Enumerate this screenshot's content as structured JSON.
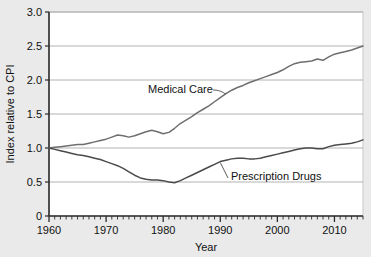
{
  "chart_data": {
    "type": "line",
    "title": "",
    "xlabel": "Year",
    "ylabel": "Index relative to CPI",
    "xlim": [
      1960,
      2015
    ],
    "ylim": [
      0,
      3.0
    ],
    "grid": true,
    "legend_position": "inline-annotation",
    "x_tick_labels": [
      "1960",
      "1970",
      "1980",
      "1990",
      "2000",
      "2010"
    ],
    "x_ticks": [
      1960,
      1970,
      1980,
      1990,
      2000,
      2010
    ],
    "x_minor_tick_step": 1,
    "y_tick_labels": [
      "0",
      "0.5",
      "1.0",
      "1.5",
      "2.0",
      "2.5",
      "3.0"
    ],
    "y_ticks": [
      0,
      0.5,
      1.0,
      1.5,
      2.0,
      2.5,
      3.0
    ],
    "x": [
      1960,
      1961,
      1962,
      1963,
      1964,
      1965,
      1966,
      1967,
      1968,
      1969,
      1970,
      1971,
      1972,
      1973,
      1974,
      1975,
      1976,
      1977,
      1978,
      1979,
      1980,
      1981,
      1982,
      1983,
      1984,
      1985,
      1986,
      1987,
      1988,
      1989,
      1990,
      1991,
      1992,
      1993,
      1994,
      1995,
      1996,
      1997,
      1998,
      1999,
      2000,
      2001,
      2002,
      2003,
      2004,
      2005,
      2006,
      2007,
      2008,
      2009,
      2010,
      2011,
      2012,
      2013,
      2014,
      2015
    ],
    "series": [
      {
        "name": "Medical Care",
        "color": "#6e6e6e",
        "label_annotation": "Medical Care",
        "values": [
          1.0,
          1.01,
          1.02,
          1.03,
          1.04,
          1.05,
          1.05,
          1.07,
          1.09,
          1.11,
          1.13,
          1.16,
          1.19,
          1.18,
          1.16,
          1.18,
          1.21,
          1.24,
          1.26,
          1.24,
          1.21,
          1.23,
          1.29,
          1.36,
          1.41,
          1.46,
          1.52,
          1.57,
          1.62,
          1.68,
          1.74,
          1.8,
          1.85,
          1.89,
          1.92,
          1.96,
          1.99,
          2.02,
          2.05,
          2.08,
          2.11,
          2.15,
          2.2,
          2.24,
          2.26,
          2.27,
          2.28,
          2.31,
          2.29,
          2.34,
          2.38,
          2.4,
          2.42,
          2.44,
          2.47,
          2.5
        ]
      },
      {
        "name": "Prescription Drugs",
        "color": "#4a4a4a",
        "label_annotation": "Prescription Drugs",
        "values": [
          1.0,
          0.98,
          0.96,
          0.94,
          0.92,
          0.9,
          0.89,
          0.87,
          0.85,
          0.83,
          0.8,
          0.77,
          0.74,
          0.7,
          0.65,
          0.6,
          0.56,
          0.54,
          0.53,
          0.53,
          0.52,
          0.5,
          0.49,
          0.52,
          0.56,
          0.6,
          0.64,
          0.68,
          0.72,
          0.76,
          0.8,
          0.82,
          0.84,
          0.85,
          0.85,
          0.84,
          0.84,
          0.85,
          0.87,
          0.89,
          0.91,
          0.93,
          0.95,
          0.97,
          0.99,
          1.0,
          1.0,
          0.99,
          0.99,
          1.02,
          1.04,
          1.05,
          1.06,
          1.07,
          1.09,
          1.12
        ]
      }
    ]
  }
}
